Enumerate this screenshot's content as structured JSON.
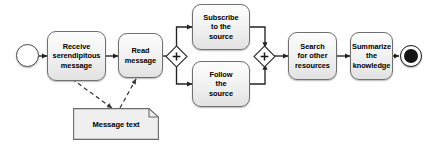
{
  "diagram": {
    "type": "uml-activity-diagram",
    "background_color": "#ffffff",
    "stroke_color": "#6f6f6f",
    "line_color": "#2b2b2b",
    "text_color": "#000000"
  },
  "nodes": {
    "start": {
      "name": "start-node",
      "kind": "initial-node",
      "label": ""
    },
    "receive": {
      "name": "activity-receive-serendipitous-message",
      "kind": "activity",
      "lines": [
        "Receive",
        "serendipitous",
        "message"
      ]
    },
    "read": {
      "name": "activity-read-message",
      "kind": "activity",
      "lines": [
        "Read",
        "message"
      ]
    },
    "fork": {
      "name": "fork-gateway",
      "kind": "gateway",
      "symbol": "+"
    },
    "subscribe": {
      "name": "activity-subscribe-to-the-source",
      "kind": "activity",
      "lines": [
        "Subscribe",
        "to the",
        "source"
      ]
    },
    "follow": {
      "name": "activity-follow-the-source",
      "kind": "activity",
      "lines": [
        "Follow",
        "the",
        "source"
      ]
    },
    "join": {
      "name": "join-gateway",
      "kind": "gateway",
      "symbol": "+"
    },
    "search": {
      "name": "activity-search-for-other-resources",
      "kind": "activity",
      "lines": [
        "Search",
        "for other",
        "resources"
      ]
    },
    "summarize": {
      "name": "activity-summarize-the-knowledge",
      "kind": "activity",
      "lines": [
        "Summarize",
        "the",
        "knowledge"
      ]
    },
    "note": {
      "name": "data-object-message-text",
      "kind": "note",
      "label": "Message text"
    },
    "end": {
      "name": "end-node",
      "kind": "final-node",
      "label": ""
    }
  },
  "edges": [
    {
      "name": "edge-start-to-receive",
      "from": "start",
      "to": "receive",
      "style": "solid"
    },
    {
      "name": "edge-receive-to-read",
      "from": "receive",
      "to": "read",
      "style": "solid"
    },
    {
      "name": "edge-read-to-fork",
      "from": "read",
      "to": "fork",
      "style": "solid"
    },
    {
      "name": "edge-fork-to-subscribe",
      "from": "fork",
      "to": "subscribe",
      "style": "solid"
    },
    {
      "name": "edge-fork-to-follow",
      "from": "fork",
      "to": "follow",
      "style": "solid"
    },
    {
      "name": "edge-subscribe-to-join",
      "from": "subscribe",
      "to": "join",
      "style": "solid"
    },
    {
      "name": "edge-follow-to-join",
      "from": "follow",
      "to": "join",
      "style": "solid"
    },
    {
      "name": "edge-join-to-search",
      "from": "join",
      "to": "search",
      "style": "solid"
    },
    {
      "name": "edge-search-to-summarize",
      "from": "search",
      "to": "summarize",
      "style": "solid"
    },
    {
      "name": "edge-summarize-to-end",
      "from": "summarize",
      "to": "end",
      "style": "solid"
    },
    {
      "name": "edge-receive-to-note",
      "from": "receive",
      "to": "note",
      "style": "dashed"
    },
    {
      "name": "edge-note-to-read",
      "from": "note",
      "to": "read",
      "style": "dashed"
    }
  ]
}
